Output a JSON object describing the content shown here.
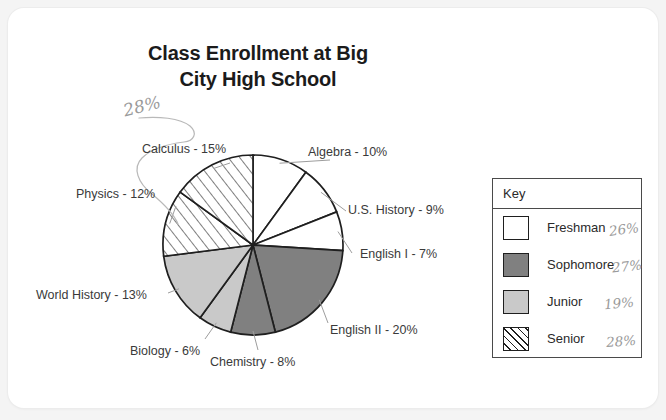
{
  "chart_data": {
    "type": "pie",
    "title": "Class Enrollment at Big City High School",
    "title_line1": "Class Enrollment at Big",
    "title_line2": "City High School",
    "categories": [
      "Algebra",
      "U.S. History",
      "English I",
      "English II",
      "Chemistry",
      "Biology",
      "World History",
      "Physics",
      "Calculus"
    ],
    "values": [
      10,
      9,
      7,
      20,
      8,
      6,
      13,
      12,
      15
    ],
    "labels": [
      "Algebra - 10%",
      "U.S. History - 9%",
      "English I - 7%",
      "English II - 20%",
      "Chemistry - 8%",
      "Biology - 6%",
      "World History - 13%",
      "Physics - 12%",
      "Calculus - 15%"
    ],
    "groups": [
      "Freshman",
      "Freshman",
      "Freshman",
      "Sophomore",
      "Sophomore",
      "Junior",
      "Junior",
      "Senior",
      "Senior"
    ],
    "slice_fills": [
      "#ffffff",
      "#ffffff",
      "#ffffff",
      "#808080",
      "#808080",
      "#c9c9c9",
      "#c9c9c9",
      "hatch",
      "hatch"
    ],
    "start_angle_deg": 0,
    "direction": "clockwise",
    "legend_position": "right",
    "grid": false
  },
  "legend": {
    "title": "Key",
    "items": [
      {
        "label": "Freshman",
        "fill": "#ffffff",
        "pattern": "solid",
        "annotation": "26%"
      },
      {
        "label": "Sophomore",
        "fill": "#808080",
        "pattern": "solid",
        "annotation": "27%"
      },
      {
        "label": "Junior",
        "fill": "#c9c9c9",
        "pattern": "solid",
        "annotation": "19%"
      },
      {
        "label": "Senior",
        "fill": "#ffffff",
        "pattern": "hatch",
        "annotation": "28%"
      }
    ]
  },
  "annotations": {
    "senior_callout": "28%"
  },
  "colors": {
    "page_background": "#f4f4f4",
    "card_background": "#ffffff",
    "outline": "#1f1f1f",
    "text": "#3a3a3a",
    "title_text": "#1b1b1b",
    "handwriting": "#9a9a9a"
  }
}
